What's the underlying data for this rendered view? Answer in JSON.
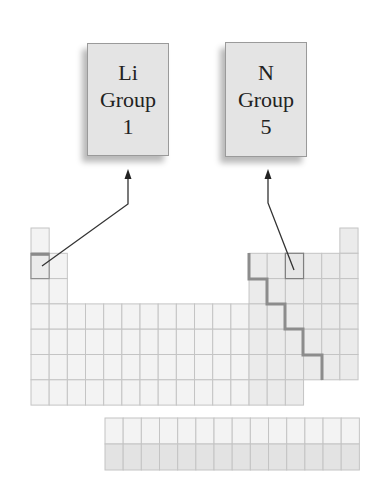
{
  "boxes": {
    "lithium": {
      "symbol": "Li",
      "label": "Group",
      "group": "1"
    },
    "nitrogen": {
      "symbol": "N",
      "label": "Group",
      "group": "5"
    }
  },
  "colors": {
    "cell_fill": "#f3f3f3",
    "p_block_fill": "#ebebeb",
    "actinide_fill": "#e3e3e3",
    "grid_line": "#c4c4c4",
    "staircase": "#8c8c8c",
    "arrow": "#333333",
    "box_fill": "#e4e4e4"
  },
  "table": {
    "columns": 18,
    "main_rows": 7,
    "f_block_rows": 2,
    "f_block_columns": 14,
    "highlighted_cells": [
      {
        "element": "Li",
        "row": 2,
        "column": 1
      },
      {
        "element": "N",
        "row": 2,
        "column": 15
      }
    ]
  }
}
